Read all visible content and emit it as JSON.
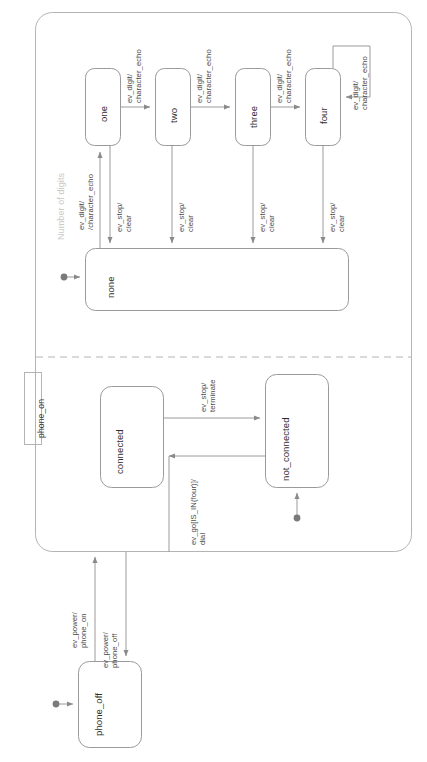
{
  "diagram": {
    "type": "uml-state-machine",
    "orientation": "rotated-90-ccw"
  },
  "composite": {
    "name": "phone_on",
    "region_label": "Number of digits"
  },
  "states": {
    "phone_off": "phone_off",
    "connected": "connected",
    "not_connected": "not_connected",
    "none": "none",
    "one": "one",
    "two": "two",
    "three": "three",
    "four": "four"
  },
  "transitions": {
    "power_on": "ev_power/\nphone_on",
    "power_off": "ev_power/\nphone_off",
    "terminate": "ev_stop/\nterminate",
    "dial": "ev_go[IS_IN(four)]/\ndial",
    "none_to_one": "ev_digit/\n/character_echo",
    "one_to_two": "ev_digit/\ncharacter_echo",
    "two_to_three": "ev_digit/\ncharacter_echo",
    "three_to_four": "ev_digit/\ncharacter_echo",
    "four_self": "ev_digit/\ncharacter_echo",
    "one_stop": "ev_stop/\nclear",
    "two_stop": "ev_stop/\nclear",
    "three_stop": "ev_stop/\nclear",
    "four_stop": "ev_stop/\nclear"
  },
  "colors": {
    "stroke": "#8a8a8a",
    "text": "#3b3b3b",
    "region_label": "#c9c9c9",
    "background": "#ffffff"
  }
}
